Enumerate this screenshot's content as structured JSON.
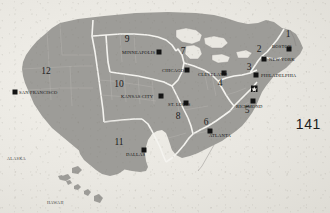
{
  "page": {
    "folio": "141",
    "background_color": "#e9e7e1",
    "land_color": "#9d9c98",
    "boundary_color": "#f4f3ef",
    "marker_color": "#131313"
  },
  "map": {
    "districts": [
      {
        "number": "1",
        "city": "BOSTON",
        "num_x": 288,
        "num_y": 37,
        "label_x": 272,
        "label_y": 48,
        "marker_x": 290,
        "marker_y": 50,
        "label_anchor": "start"
      },
      {
        "number": "2",
        "city": "NEW YORK",
        "num_x": 259,
        "num_y": 52,
        "label_x": 270,
        "label_y": 61,
        "marker_x": 264,
        "marker_y": 59,
        "label_anchor": "start"
      },
      {
        "number": "3",
        "city": "PHILADELPHIA",
        "num_x": 249,
        "num_y": 70,
        "label_x": 262,
        "label_y": 77,
        "marker_x": 256,
        "marker_y": 75,
        "label_anchor": "start"
      },
      {
        "number": "4",
        "city": "CLEVELAND",
        "num_x": 220,
        "num_y": 86,
        "label_x": 199,
        "label_y": 76,
        "marker_x": 224,
        "marker_y": 73,
        "label_anchor": "start"
      },
      {
        "number": "5",
        "city": "RICHMOND",
        "num_x": 247,
        "num_y": 113,
        "label_x": 240,
        "label_y": 108,
        "marker_x": 253,
        "marker_y": 101,
        "label_anchor": "start"
      },
      {
        "number": "6",
        "city": "ATLANTA",
        "num_x": 206,
        "num_y": 125,
        "label_x": 213,
        "label_y": 137,
        "marker_x": 210,
        "marker_y": 131,
        "label_anchor": "start"
      },
      {
        "number": "7",
        "city": "CHICAGO",
        "num_x": 183,
        "num_y": 54,
        "label_x": 163,
        "label_y": 72,
        "marker_x": 187,
        "marker_y": 70,
        "label_anchor": "start"
      },
      {
        "number": "8",
        "city": "ST. LOUIS",
        "num_x": 178,
        "num_y": 119,
        "label_x": 170,
        "label_y": 108,
        "marker_x": 186,
        "marker_y": 103,
        "label_anchor": "start"
      },
      {
        "number": "9",
        "city": "MINNEAPOLIS",
        "num_x": 127,
        "num_y": 42,
        "label_x": 122,
        "label_y": 54,
        "marker_x": 159,
        "marker_y": 52,
        "label_anchor": "start"
      },
      {
        "number": "10",
        "city": "KANSAS CITY",
        "num_x": 119,
        "num_y": 87,
        "label_x": 120,
        "label_y": 98,
        "marker_x": 161,
        "marker_y": 96,
        "label_anchor": "start"
      },
      {
        "number": "11",
        "city": "DALLAS",
        "num_x": 119,
        "num_y": 145,
        "label_x": 127,
        "label_y": 156,
        "marker_x": 144,
        "marker_y": 150,
        "label_anchor": "start"
      },
      {
        "number": "12",
        "city": "SAN FRANCISCO",
        "num_x": 46,
        "num_y": 74,
        "label_x": 21,
        "label_y": 94,
        "marker_x": 15,
        "marker_y": 92,
        "label_anchor": "start"
      }
    ],
    "capital_marker": {
      "name": "WASHINGTON DC",
      "x": 254,
      "y": 89
    },
    "insets": [
      {
        "name": "ALASKA",
        "label_x": 7,
        "label_y": 160
      },
      {
        "name": "HAWAII",
        "label_x": 47,
        "label_y": 204
      }
    ]
  }
}
